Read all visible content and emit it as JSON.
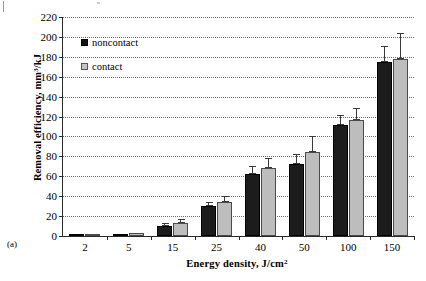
{
  "figure": {
    "panel_tag": "(a)",
    "ylabel_main": "Removal efficiency,  mm",
    "ylabel_sup": "3",
    "ylabel_tail": "/kJ",
    "xlabel_main": "Energy density,  J/cm",
    "xlabel_sup": "2"
  },
  "legend": {
    "entries": [
      {
        "label": "noncontact",
        "color": "#1c1c1c"
      },
      {
        "label": "contact",
        "color": "#bdbdbd"
      }
    ]
  },
  "chart_data": {
    "type": "bar",
    "title": "",
    "xlabel": "Energy density,  J/cm2",
    "ylabel": "Removal efficiency,  mm3/kJ",
    "categories": [
      "2",
      "5",
      "15",
      "25",
      "40",
      "50",
      "100",
      "150"
    ],
    "ylim": [
      0,
      220
    ],
    "yticks": [
      0,
      20,
      40,
      60,
      80,
      100,
      120,
      140,
      160,
      180,
      200,
      220
    ],
    "ytick_labels": [
      "0",
      "20",
      "40",
      "60",
      "80",
      "100",
      "120",
      "140",
      "160",
      "180",
      "200",
      "220"
    ],
    "grid": true,
    "legend_position": "upper-left-inside",
    "series": [
      {
        "name": "noncontact",
        "color": "#1c1c1c",
        "values": [
          1,
          2,
          10,
          30,
          62,
          72,
          112,
          175
        ],
        "errors": [
          0.5,
          1,
          1.5,
          2,
          4,
          5,
          5,
          8
        ]
      },
      {
        "name": "contact",
        "color": "#bdbdbd",
        "values": [
          1,
          3,
          13,
          34,
          68,
          84,
          117,
          178
        ],
        "errors": [
          0.5,
          1,
          2,
          3,
          5,
          8,
          6,
          13
        ]
      }
    ]
  }
}
